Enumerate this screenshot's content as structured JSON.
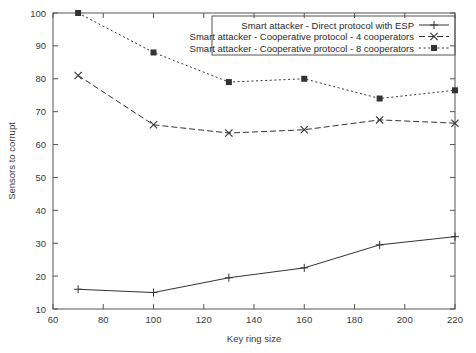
{
  "chart_data": {
    "type": "line",
    "title": "",
    "xlabel": "Key ring size",
    "ylabel": "Sensors to corrupt",
    "xlim": [
      60,
      220
    ],
    "ylim": [
      10,
      100
    ],
    "xticks": [
      60,
      80,
      100,
      120,
      140,
      160,
      180,
      200,
      220
    ],
    "yticks": [
      10,
      20,
      30,
      40,
      50,
      60,
      70,
      80,
      90,
      100
    ],
    "grid": false,
    "legend_position": "top-right",
    "x": [
      70,
      100,
      130,
      160,
      190,
      220
    ],
    "series": [
      {
        "name": "Smart attacker - Direct protocol with ESP",
        "values": [
          16,
          15,
          19.5,
          22.5,
          29.5,
          32
        ],
        "style": "solid",
        "marker": "plus"
      },
      {
        "name": "Smart attacker - Cooperative protocol - 4 cooperators",
        "values": [
          81,
          66,
          63.5,
          64.5,
          67.5,
          66.5
        ],
        "style": "dashed",
        "marker": "cross"
      },
      {
        "name": "Smart attacker - Cooperative protocol - 8 cooperators",
        "values": [
          100,
          88,
          79,
          80,
          74,
          76.5
        ],
        "style": "dotted",
        "marker": "square"
      }
    ]
  },
  "colors": {
    "line": "#333333",
    "axis": "#555555",
    "text": "#3a3a3a",
    "background": "#ffffff"
  }
}
